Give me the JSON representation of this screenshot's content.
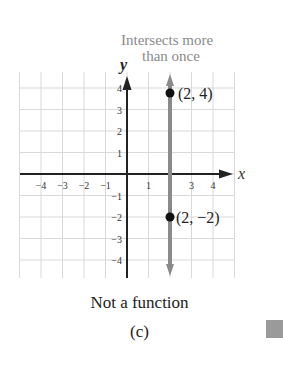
{
  "figure": {
    "annotation_line1": "Intersects more",
    "annotation_line2": "than once",
    "y_axis_label": "y",
    "x_axis_label": "x",
    "point_top_label": "(2, 4)",
    "point_bottom_label": "(2, −2)",
    "caption": "Not a function",
    "sublabel": "(c)"
  },
  "colors": {
    "grid": "#d9d9d9",
    "axis": "#222222",
    "vertical_line": "#8a8a8a",
    "point": "#111111",
    "annotation": "#8a8a8a",
    "side_marker": "#9a9a9a"
  },
  "chart_data": {
    "type": "line",
    "title": "Not a function",
    "subtitle": "(c)",
    "xlabel": "x",
    "ylabel": "y",
    "xlim": [
      -5,
      5
    ],
    "ylim": [
      -5,
      5
    ],
    "grid": true,
    "x_ticks": [
      -4,
      -3,
      -2,
      -1,
      1,
      3,
      4
    ],
    "y_ticks": [
      -4,
      -3,
      -2,
      -1,
      1,
      2,
      3,
      4
    ],
    "series": [
      {
        "name": "vertical line x = 2",
        "x": [
          2,
          2
        ],
        "y": [
          -5,
          5
        ]
      }
    ],
    "points": [
      {
        "x": 2,
        "y": 4,
        "label": "(2, 4)"
      },
      {
        "x": 2,
        "y": -2,
        "label": "(2, −2)"
      }
    ],
    "annotations": [
      "Intersects more than once"
    ]
  }
}
